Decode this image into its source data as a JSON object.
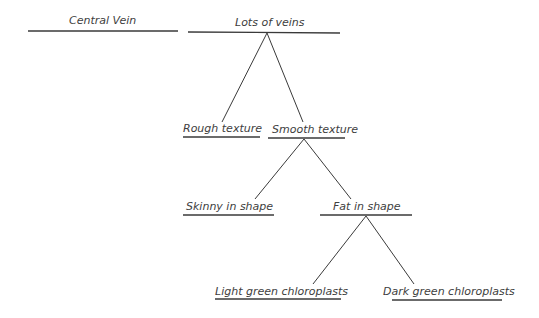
{
  "diagram": {
    "line_color": "#3a3a3a",
    "text_color": "#404040",
    "nodes": [
      {
        "id": "central-vein",
        "label": "Central Vein"
      },
      {
        "id": "lots-of-veins",
        "label": "Lots of veins"
      },
      {
        "id": "rough-texture",
        "label": "Rough texture"
      },
      {
        "id": "smooth-texture",
        "label": "Smooth texture"
      },
      {
        "id": "skinny-in-shape",
        "label": "Skinny in shape"
      },
      {
        "id": "fat-in-shape",
        "label": "Fat in shape"
      },
      {
        "id": "light-green-chloroplasts",
        "label": "Light green chloroplasts"
      },
      {
        "id": "dark-green-chloroplasts",
        "label": "Dark green chloroplasts"
      }
    ],
    "edges": [
      {
        "from": "lots-of-veins",
        "to": "rough-texture"
      },
      {
        "from": "lots-of-veins",
        "to": "smooth-texture"
      },
      {
        "from": "smooth-texture",
        "to": "skinny-in-shape"
      },
      {
        "from": "smooth-texture",
        "to": "fat-in-shape"
      },
      {
        "from": "fat-in-shape",
        "to": "light-green-chloroplasts"
      },
      {
        "from": "fat-in-shape",
        "to": "dark-green-chloroplasts"
      }
    ]
  }
}
